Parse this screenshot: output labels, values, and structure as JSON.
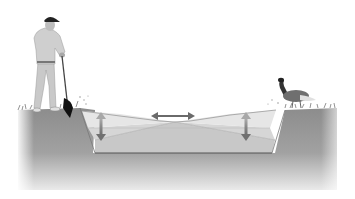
{
  "diagram": {
    "type": "pond-cross-section-illustration",
    "elements": [
      {
        "name": "person",
        "description": "man in cap holding a long-handled tool standing on left bank"
      },
      {
        "name": "goose",
        "description": "goose standing on right bank"
      },
      {
        "name": "pond",
        "description": "trapezoidal pond basin with layered water levels"
      },
      {
        "name": "horizontal-arrow",
        "description": "double-headed arrow above water surface"
      },
      {
        "name": "left-vertical-arrow",
        "description": "double-headed vertical arrow at left of pond"
      },
      {
        "name": "right-vertical-arrow",
        "description": "double-headed vertical arrow at right of pond"
      }
    ],
    "colors": {
      "ground": "#8f8f8f",
      "ground_fade": "#e6e6e6",
      "water_light": "#e4e4e4",
      "water_mid": "#d2d2d2",
      "water_deep": "#c4c4c4",
      "arrow": "#6a6a6a",
      "arrow_pale": "#a8a8a8"
    }
  }
}
